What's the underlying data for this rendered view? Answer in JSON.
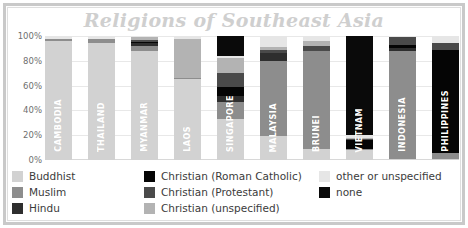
{
  "title": "Religions of Southeast Asia",
  "colors": {
    "buddhist": "#d2d2d2",
    "muslim": "#8d8d8d",
    "hindu": "#2e2e2e",
    "roman_catholic": "#050505",
    "protestant": "#4a4a4a",
    "christian_unspecified": "#b3b3b3",
    "other_or_unspecified": "#e6e6e6",
    "none": "#0a0a0a",
    "frame": "#c9c9c9",
    "title_text": "#cfcfcf",
    "gridline": "#e8e8e8",
    "axis_text": "#6f6f6f",
    "legend_text": "#3b3b3b",
    "bar_label_text": "#ffffff"
  },
  "legend": {
    "columns": [
      {
        "items": [
          {
            "label": "Buddhist",
            "key": "buddhist"
          },
          {
            "label": "Muslim",
            "key": "muslim"
          },
          {
            "label": "Hindu",
            "key": "hindu"
          }
        ]
      },
      {
        "items": [
          {
            "label": "Christian (Roman Catholic)",
            "key": "roman_catholic"
          },
          {
            "label": "Christian (Protestant)",
            "key": "protestant"
          },
          {
            "label": "Christian (unspecified)",
            "key": "christian_unspecified"
          }
        ]
      },
      {
        "items": [
          {
            "label": "other or unspecified",
            "key": "other_or_unspecified"
          },
          {
            "label": "none",
            "key": "none"
          }
        ]
      }
    ]
  },
  "chart_data": {
    "type": "bar",
    "subtype": "stacked-percentage",
    "title": "Religions of Southeast Asia",
    "xlabel": "",
    "ylabel": "",
    "ylim": [
      0,
      100
    ],
    "yticks": [
      "0%",
      "20%",
      "40%",
      "60%",
      "80%",
      "100%"
    ],
    "ytick_values": [
      0,
      20,
      40,
      60,
      80,
      100
    ],
    "grid": true,
    "legend_position": "bottom",
    "categories": [
      "CAMBODIA",
      "THAILAND",
      "MYANMAR",
      "LAOS",
      "SINGAPORE",
      "MALAYSIA",
      "BRUNEI",
      "VIETNAM",
      "INDONESIA",
      "PHILIPPINES"
    ],
    "series": [
      {
        "name": "Buddhist",
        "key": "buddhist",
        "values": [
          96,
          94,
          88,
          65,
          33,
          19,
          9,
          8,
          1,
          1
        ]
      },
      {
        "name": "Muslim",
        "key": "muslim",
        "values": [
          2,
          4,
          4,
          1,
          14,
          61,
          79,
          1,
          87,
          5
        ]
      },
      {
        "name": "Hindu",
        "key": "hindu",
        "values": [
          0,
          0,
          2,
          0,
          5,
          6,
          0,
          0,
          2,
          0
        ]
      },
      {
        "name": "Christian (Roman Catholic)",
        "key": "roman_catholic",
        "values": [
          0,
          0,
          1,
          0,
          7,
          0,
          0,
          7,
          3,
          83
        ]
      },
      {
        "name": "Christian (Protestant)",
        "key": "protestant",
        "values": [
          0,
          0,
          2,
          0,
          11,
          3,
          4,
          1,
          6,
          5
        ]
      },
      {
        "name": "Christian (unspecified)",
        "key": "christian_unspecified",
        "values": [
          0,
          0,
          2,
          32,
          12,
          2,
          4,
          1,
          0,
          0
        ]
      },
      {
        "name": "other or unspecified",
        "key": "other_or_unspecified",
        "values": [
          2,
          2,
          1,
          2,
          2,
          9,
          4,
          2,
          1,
          6
        ]
      },
      {
        "name": "none",
        "key": "none",
        "values": [
          0,
          0,
          0,
          0,
          16,
          0,
          0,
          80,
          0,
          0
        ]
      }
    ]
  }
}
